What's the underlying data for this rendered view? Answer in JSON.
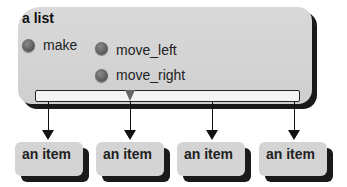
{
  "list": {
    "title": "a list",
    "methods": [
      {
        "label": "make"
      },
      {
        "label": "move_left"
      },
      {
        "label": "move_right"
      }
    ]
  },
  "items": [
    {
      "label": "an item"
    },
    {
      "label": "an item"
    },
    {
      "label": "an item"
    },
    {
      "label": "an item"
    }
  ],
  "colors": {
    "box_fill": "#d4d4d4",
    "shadow": "#1a1a1a",
    "dot": "#666666",
    "bar_fill": "#f4f4f4",
    "arrow": "#111111"
  }
}
